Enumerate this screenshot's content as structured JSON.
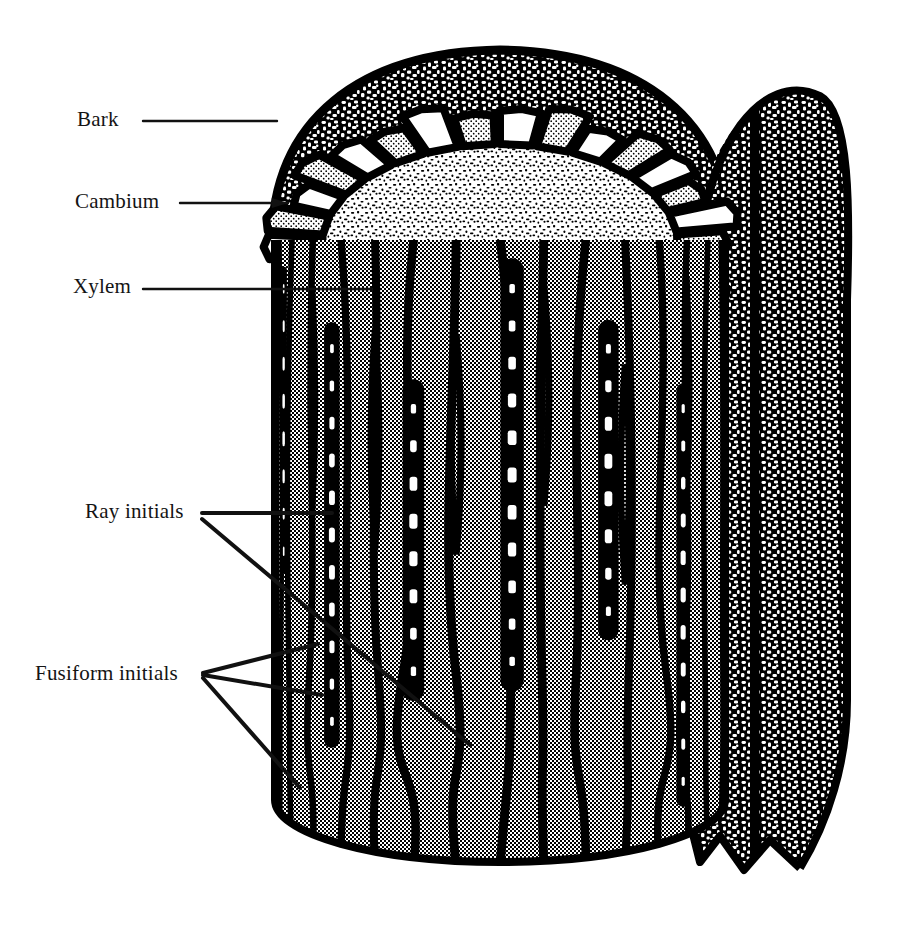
{
  "figure": {
    "background_color": "#ffffff",
    "ink_color": "#000000",
    "cell_fill_gray": "#9a9a9a",
    "stipple_gray": "#c8c8c8"
  },
  "labels": {
    "bark": "Bark",
    "cambium": "Cambium",
    "xylem": "Xylem",
    "ray_initials": "Ray initials",
    "fusiform_initials": "Fusiform initials"
  },
  "leaders": {
    "bark": {
      "from_x": 143,
      "from_y": 121,
      "to_x": 277,
      "to_y": 121,
      "arrow": false
    },
    "cambium": {
      "from_x": 180,
      "from_y": 203,
      "to_x": 288,
      "to_y": 203,
      "arrow": true
    },
    "xylem": {
      "from_x": 143,
      "from_y": 289,
      "to_x": 372,
      "to_y": 289,
      "arrow": false
    },
    "ray_initials_1": {
      "from_x": 202,
      "from_y": 513,
      "to_x": 332,
      "to_y": 513,
      "arrow": false
    },
    "ray_initials_2": {
      "from_x": 202,
      "from_y": 519,
      "to_x": 470,
      "to_y": 745,
      "arrow": false
    },
    "fusiform_1": {
      "from_x": 203,
      "from_y": 673,
      "to_x": 318,
      "to_y": 644,
      "arrow": false
    },
    "fusiform_2": {
      "from_x": 203,
      "from_y": 675,
      "to_x": 322,
      "to_y": 695,
      "arrow": false
    },
    "fusiform_3": {
      "from_x": 203,
      "from_y": 678,
      "to_x": 300,
      "to_y": 788,
      "arrow": false
    }
  },
  "regions": {
    "bark_texture": "coarse-mottled-black-white",
    "cambium_cells": "blocky-quadrilateral-ring",
    "xylem_core": "fine-speckled",
    "fusiform_face": "halftone-gray-elongated-columns",
    "ray_cells": "white-bead-chains"
  },
  "geometry": {
    "top_ellipse_center_x": 500,
    "top_ellipse_center_y": 245,
    "top_ellipse_rx": 225,
    "top_ellipse_ry": 130,
    "cylinder_bottom_y": 860,
    "cylinder_left_x": 275,
    "cylinder_right_x": 725,
    "bark_flap_right_x": 845,
    "bark_flap_bottom_y": 870,
    "cambium_cell_count": 30,
    "fusiform_column_count": 16,
    "ray_chain_count": 7
  }
}
